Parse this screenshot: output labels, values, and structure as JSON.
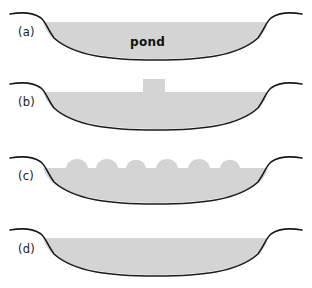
{
  "figure": {
    "width": 312,
    "height": 288,
    "background_color": "#ffffff",
    "fill_color": "#d4d4d4",
    "outline_color": "#1a1a1a",
    "text_color": "#1a1a1a"
  },
  "panels": [
    {
      "id": "a",
      "label": "(a)",
      "label_top": 27,
      "panel_top": 0,
      "caption": "pond",
      "annotation": {
        "text": "pond",
        "left": 130,
        "top": 36
      },
      "description": "Open basin filled with water, labelled pond"
    },
    {
      "id": "b",
      "label": "(b)",
      "label_top": 97,
      "panel_top": 70,
      "annotation": null,
      "block": {
        "left": 143,
        "right": 165,
        "top": 9,
        "description": "single rectangular mound rising above fill surface"
      },
      "description": "Basin fill with one central rectangular block protruding"
    },
    {
      "id": "c",
      "label": "(c)",
      "label_top": 171,
      "panel_top": 144,
      "annotation": null,
      "bumps": 6,
      "description": "Basin fill with six rounded bumps along the surface"
    },
    {
      "id": "d",
      "label": "(d)",
      "label_top": 244,
      "panel_top": 216,
      "annotation": null,
      "description": "Basin fill with flat level surface"
    }
  ]
}
